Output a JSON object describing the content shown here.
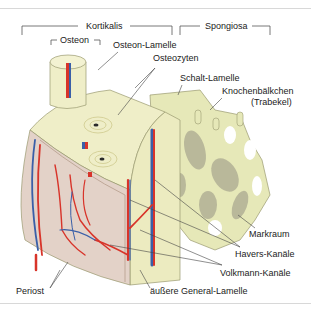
{
  "diagram": {
    "brackets": {
      "kortikalis": "Kortikalis",
      "spongiosa": "Spongiosa",
      "osteon": "Osteon"
    },
    "labels": {
      "osteon_lamelle": "Osteon-Lamelle",
      "osteozyten": "Osteozyten",
      "schalt_lamelle": "Schalt-Lamelle",
      "knochenbaelkchen": "Knochenbälkchen",
      "trabekel": "(Trabekel)",
      "markraum": "Markraum",
      "havers_kanaele": "Havers-Kanäle",
      "volkmann_kanaele": "Volkmann-Kanäle",
      "aeussere_general_lamelle": "äußere General-Lamelle",
      "periost": "Periost"
    },
    "colors": {
      "bone": "#efeec8",
      "bone_dark": "#d9d7a6",
      "trabecula": "#e6e8b8",
      "trabecula_shadow": "#b9b89a",
      "artery": "#d8342a",
      "vein": "#3a5fa8",
      "periost": "#e3d2c8",
      "line": "#444444"
    }
  }
}
